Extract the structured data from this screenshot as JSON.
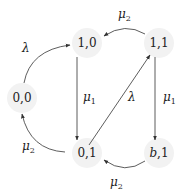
{
  "diagram": {
    "type": "state-transition",
    "nodes": [
      {
        "id": "n00",
        "label": "0,0",
        "x": 22,
        "y": 98
      },
      {
        "id": "n10",
        "label": "1,0",
        "x": 87,
        "y": 43
      },
      {
        "id": "n11",
        "label": "1,1",
        "x": 159,
        "y": 43
      },
      {
        "id": "n01",
        "label": "0,1",
        "x": 87,
        "y": 153
      },
      {
        "id": "nb1",
        "label_main": "b",
        "label_rest": ",1",
        "x": 159,
        "y": 153
      }
    ],
    "edges": [
      {
        "from": "0,0",
        "to": "1,0",
        "label": "λ"
      },
      {
        "from": "1,1",
        "to": "1,0",
        "label": "μ",
        "sub": "2"
      },
      {
        "from": "1,0",
        "to": "0,1",
        "label": "μ",
        "sub": "1"
      },
      {
        "from": "0,1",
        "to": "1,1",
        "label": "λ"
      },
      {
        "from": "1,1",
        "to": "b,1",
        "label": "μ",
        "sub": "1"
      },
      {
        "from": "0,1",
        "to": "0,0",
        "label": "μ",
        "sub": "2"
      },
      {
        "from": "b,1",
        "to": "0,1",
        "label": "μ",
        "sub": "2"
      }
    ]
  }
}
